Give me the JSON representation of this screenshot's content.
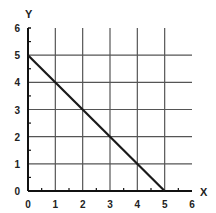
{
  "chart_data": {
    "type": "line",
    "title": "",
    "xlabel": "X",
    "ylabel": "Y",
    "xlim": [
      0,
      6
    ],
    "ylim": [
      0,
      6
    ],
    "x_ticks": [
      "0",
      "1",
      "2",
      "3",
      "4",
      "5",
      "6"
    ],
    "y_ticks": [
      "0",
      "1",
      "2",
      "3",
      "4",
      "5",
      "6"
    ],
    "grid": true,
    "grid_x": [
      1,
      2,
      3,
      4,
      5
    ],
    "grid_y": [
      1,
      2,
      3,
      4,
      5
    ],
    "series": [
      {
        "name": "line",
        "x": [
          0,
          5
        ],
        "y": [
          5,
          0
        ]
      }
    ],
    "colors": {
      "line": "#1a1a1a",
      "grid": "#555555",
      "axis": "#111111"
    }
  }
}
